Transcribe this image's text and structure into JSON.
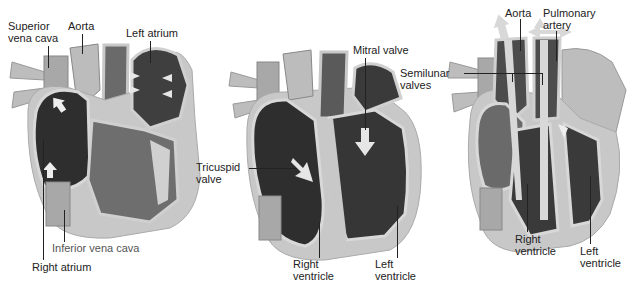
{
  "diagram": {
    "colors": {
      "chamber_dark": "#3a3a3a",
      "muscle_mid": "#6e6e6e",
      "wall_light": "#c8c8c8",
      "vessel_light": "#b0b0b0",
      "arrow": "#e6e6e6",
      "label_text": "#222222",
      "background": "#ffffff"
    },
    "panels": [
      {
        "id": "atrial-filling",
        "labels": {
          "superior_vena_cava": [
            "Superior",
            "vena cava"
          ],
          "aorta": "Aorta",
          "left_atrium": "Left atrium",
          "inferior_vena_cava": "Inferior vena cava",
          "right_atrium": "Right atrium"
        }
      },
      {
        "id": "ventricular-filling",
        "labels": {
          "mitral_valve": "Mitral valve",
          "tricuspid_valve": [
            "Tricuspid",
            "valve"
          ],
          "right_ventricle": [
            "Right",
            "ventricle"
          ],
          "left_ventricle": [
            "Left",
            "ventricle"
          ]
        }
      },
      {
        "id": "ventricular-ejection",
        "labels": {
          "aorta": "Aorta",
          "pulmonary_artery": [
            "Pulmonary",
            "artery"
          ],
          "semilunar_valves": [
            "Semilunar",
            "valves"
          ],
          "right_ventricle": [
            "Right",
            "ventricle"
          ],
          "left_ventricle": [
            "Left",
            "ventricle"
          ]
        }
      }
    ]
  }
}
